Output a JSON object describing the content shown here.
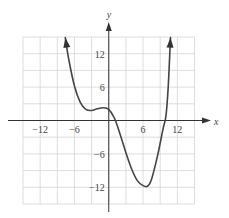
{
  "chart_data": {
    "type": "line",
    "title": "",
    "xlabel": "x",
    "ylabel": "y",
    "xlim": [
      -15,
      15
    ],
    "ylim": [
      -15,
      15
    ],
    "grid": true,
    "grid_step": 3,
    "x_ticks": [
      {
        "value": -12,
        "label": "−12"
      },
      {
        "value": -6,
        "label": "−6"
      },
      {
        "value": 6,
        "label": "6"
      },
      {
        "value": 12,
        "label": "12"
      }
    ],
    "y_ticks": [
      {
        "value": 12,
        "label": "12"
      },
      {
        "value": 6,
        "label": "6"
      },
      {
        "value": -6,
        "label": "−6"
      },
      {
        "value": -12,
        "label": "−12"
      }
    ],
    "series": [
      {
        "name": "f(x)",
        "arrow_ends": true,
        "x": [
          -7.6,
          -7,
          -6,
          -5,
          -4,
          -3,
          -2,
          -1,
          0,
          1,
          2,
          3,
          4,
          5,
          6,
          6.8,
          7.5,
          8.5,
          9.5,
          10,
          10.4,
          10.8
        ],
        "y": [
          14.9,
          11,
          6.2,
          3.3,
          2.0,
          1.8,
          2.1,
          2.3,
          2.0,
          0.4,
          -2.5,
          -5.8,
          -8.7,
          -10.8,
          -11.7,
          -11.8,
          -10.5,
          -6.5,
          -1.5,
          0.8,
          6,
          14.9
        ]
      }
    ],
    "colors": {
      "curve": "#444444",
      "axis": "#333333",
      "grid": "#d4d4d4"
    }
  }
}
